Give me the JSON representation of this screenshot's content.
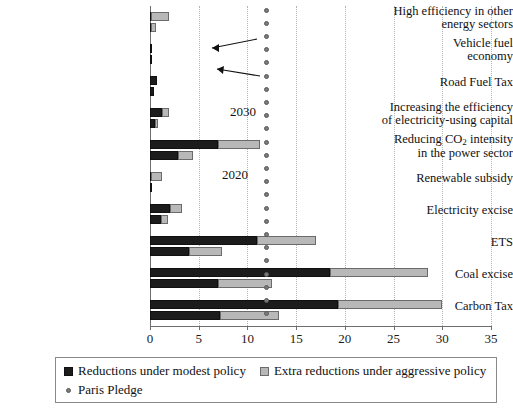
{
  "chart_data": {
    "type": "bar",
    "orientation": "horizontal",
    "title": "",
    "xlabel": "",
    "ylabel": "",
    "xlim": [
      0,
      35
    ],
    "xticks": [
      0,
      5,
      10,
      15,
      20,
      25,
      30,
      35
    ],
    "xtick_labels": [
      "0",
      "5",
      "10",
      "15",
      "20",
      "25",
      "30",
      "35"
    ],
    "grid": "vertical-dotted",
    "stacked": true,
    "categories": [
      "High efficiency in other energy sectors",
      "Vehicle fuel economy",
      "Road Fuel Tax",
      "Increasing the efficiency of electricity-using capital",
      "Reducing CO2 intensity in the power sector",
      "Renewable subsidy",
      "Electricity excise",
      "ETS",
      "Coal excise",
      "Carbon Tax"
    ],
    "category_label_lines": [
      [
        "High efficiency in other",
        "energy sectors"
      ],
      [
        "Vehicle fuel",
        "economy"
      ],
      [
        "Road Fuel Tax"
      ],
      [
        "Increasing the efficiency",
        "of electricity-using capital"
      ],
      [
        "Reducing CO",
        "in the power sector"
      ],
      [
        "Renewable subsidy"
      ],
      [
        "Electricity excise"
      ],
      [
        "ETS"
      ],
      [
        "Coal excise"
      ],
      [
        "Carbon Tax"
      ]
    ],
    "series": [
      {
        "name": "Reductions under modest policy",
        "color": "#1c1c1c",
        "year_2030": [
          0.1,
          0.15,
          0.7,
          1.2,
          7.0,
          0.1,
          2.1,
          11.0,
          18.5,
          19.3
        ],
        "year_2020": [
          0.1,
          0.05,
          0.4,
          0.5,
          2.9,
          0.05,
          1.1,
          4.0,
          7.0,
          7.2
        ]
      },
      {
        "name": "Extra reductions under aggressive policy",
        "color": "#b8b8b8",
        "year_2030": [
          1.9,
          0.15,
          0.7,
          1.9,
          11.3,
          1.2,
          3.3,
          17.0,
          28.5,
          30.0
        ],
        "year_2020": [
          0.6,
          0.05,
          0.4,
          0.8,
          4.4,
          0.05,
          1.8,
          7.4,
          12.5,
          13.2
        ]
      }
    ],
    "paris_pledge": {
      "name": "Paris Pledge",
      "value": 12.0,
      "color": "#7a7a7a",
      "marker": "dot"
    },
    "annotations": [
      {
        "text": "2030",
        "points_to": "upper bar of Reducing CO2 intensity row"
      },
      {
        "text": "2020",
        "points_to": "lower bar of Reducing CO2 intensity row"
      }
    ]
  },
  "legend": {
    "items": [
      {
        "label": "Reductions under modest policy",
        "marker": "square-dark"
      },
      {
        "label": "Extra reductions under aggressive policy",
        "marker": "square-light"
      },
      {
        "label": "Paris Pledge",
        "marker": "dot"
      }
    ]
  }
}
